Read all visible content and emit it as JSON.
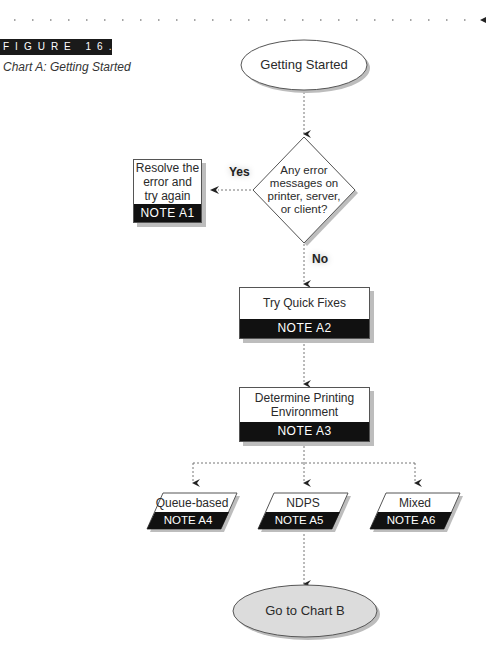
{
  "figure": {
    "label": "FIGURE 16.8",
    "caption": "Chart A: Getting Started"
  },
  "nodes": {
    "start": {
      "label": "Getting Started",
      "shape": "ellipse",
      "fill": "#ffffff"
    },
    "decision": {
      "lines": [
        "Any error",
        "messages on",
        "printer, server,",
        "or client?"
      ],
      "shape": "diamond"
    },
    "resolve": {
      "lines": [
        "Resolve the",
        "error and",
        "try again"
      ],
      "note": "NOTE A1"
    },
    "quick_fixes": {
      "label": "Try Quick Fixes",
      "note": "NOTE A2"
    },
    "determine_env": {
      "lines": [
        "Determine Printing",
        "Environment"
      ],
      "note": "NOTE A3"
    },
    "queue_based": {
      "label": "Queue-based",
      "note": "NOTE A4"
    },
    "ndps": {
      "label": "NDPS",
      "note": "NOTE A5"
    },
    "mixed": {
      "label": "Mixed",
      "note": "NOTE A6"
    },
    "end": {
      "label": "Go to Chart B",
      "shape": "ellipse",
      "fill": "#dcdcdc"
    }
  },
  "edges": {
    "yes_label": "Yes",
    "no_label": "No"
  },
  "colors": {
    "note_bg": "#111111",
    "shadow": "#bdbdbd",
    "connector": "#777777",
    "end_fill": "#dcdcdc"
  }
}
